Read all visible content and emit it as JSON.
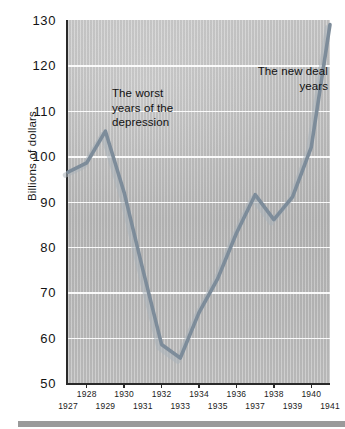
{
  "chart_data": {
    "type": "line",
    "title": "",
    "subtitle": "",
    "xlabel": "",
    "ylabel": "Billions of dollars",
    "x": [
      1927,
      1928,
      1929,
      1930,
      1931,
      1932,
      1933,
      1934,
      1935,
      1936,
      1937,
      1938,
      1939,
      1940,
      1941
    ],
    "categories": [
      "1927",
      "1928",
      "1929",
      "1930",
      "1931",
      "1932",
      "1933",
      "1934",
      "1935",
      "1936",
      "1937",
      "1938",
      "1939",
      "1940",
      "1941"
    ],
    "values": [
      96.5,
      98.5,
      105.5,
      92.0,
      75.0,
      58.5,
      55.5,
      65.5,
      73.0,
      83.0,
      91.5,
      86.0,
      91.0,
      102.0,
      129.0
    ],
    "series": [
      {
        "name": "National income",
        "values": [
          96.5,
          98.5,
          105.5,
          92.0,
          75.0,
          58.5,
          55.5,
          65.5,
          73.0,
          83.0,
          91.5,
          86.0,
          91.0,
          102.0,
          129.0
        ],
        "color": "#7d8c9a"
      }
    ],
    "ylim": [
      50,
      130
    ],
    "xlim": [
      1927,
      1941
    ],
    "yticks": [
      50,
      60,
      70,
      80,
      90,
      100,
      110,
      120,
      130
    ],
    "ytick_labels": [
      "50",
      "60",
      "70",
      "80",
      "90",
      "100",
      "110",
      "120",
      "130"
    ],
    "xticks": [
      1927,
      1928,
      1929,
      1930,
      1931,
      1932,
      1933,
      1934,
      1935,
      1936,
      1937,
      1938,
      1939,
      1940,
      1941
    ],
    "xtick_labels_upper": [
      "1928",
      "1930",
      "1932",
      "1934",
      "1936",
      "1938",
      "1940"
    ],
    "xtick_labels_lower": [
      "1927",
      "1929",
      "1931",
      "1933",
      "1935",
      "1937",
      "1939",
      "1941"
    ],
    "grid": "horizontal",
    "legend": "none",
    "annotations": [
      {
        "id": "worst",
        "text": "The worst\nyears of the\ndepression",
        "align": "left",
        "x": 1931.0,
        "y": 112.0
      },
      {
        "id": "newdeal",
        "text": "The new deal\nyears",
        "align": "right",
        "x": 1938.5,
        "y": 117.0
      }
    ]
  },
  "axes": {
    "y_title": "Billions of dollars",
    "y_ticks": [
      "130",
      "120",
      "110",
      "100",
      "90",
      "80",
      "70",
      "60",
      "50"
    ],
    "x_ticks_upper": [
      "1928",
      "1930",
      "1932",
      "1934",
      "1936",
      "1938",
      "1940"
    ],
    "x_ticks_lower": [
      "1927",
      "1929",
      "1931",
      "1933",
      "1935",
      "1937",
      "1939",
      "1941"
    ]
  },
  "annotations": {
    "worst": "The worst\nyears of the\ndepression",
    "new_deal": "The new deal\nyears"
  },
  "colors": {
    "line": "#7d8c9a",
    "line_shadow": "#a9b2ba",
    "plot_background": "#bdbdbd",
    "gridline": "#ffffff",
    "axis": "#2a2a2a",
    "text": "#141414",
    "footer_bar": "#9a9a9a"
  }
}
